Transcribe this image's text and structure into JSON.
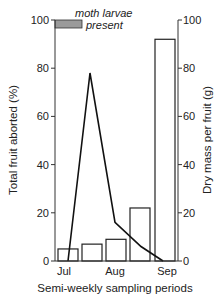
{
  "chart_data": {
    "type": "bar+line",
    "title": "",
    "xlabel": "Semi-weekly sampling periods",
    "ylabel_left": "Total fruit aborted (%)",
    "ylabel_right": "Dry mass per fruit (g)",
    "ylim_left": [
      0,
      100
    ],
    "ylim_right": [
      0,
      100
    ],
    "yticks_left": [
      0,
      20,
      40,
      60,
      80,
      100
    ],
    "yticks_right": [
      0,
      20,
      40,
      60,
      80,
      100
    ],
    "x_tick_labels": [
      "Jul",
      "Aug",
      "Sep"
    ],
    "grid": false,
    "series": [
      {
        "name": "Dry mass per fruit (g)",
        "type": "bar",
        "axis": "right",
        "values": [
          5,
          7,
          9,
          22,
          92
        ]
      },
      {
        "name": "Total fruit aborted (%)",
        "type": "line",
        "axis": "left",
        "values": [
          0,
          78,
          16,
          6,
          0
        ]
      }
    ],
    "annotations": [
      {
        "text": "moth larvae present",
        "type": "shaded-bar",
        "range": "early July period",
        "y": [
          96,
          100
        ]
      }
    ]
  },
  "labels": {
    "annotation_line1": "moth larvae",
    "annotation_line2": "present"
  }
}
